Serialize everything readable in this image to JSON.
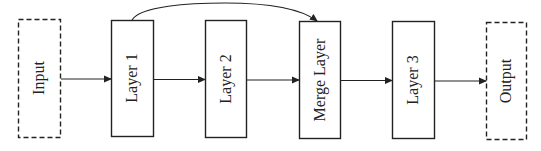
{
  "diagram": {
    "type": "flowchart",
    "direction": "left-to-right",
    "colors": {
      "stroke": "#222222",
      "background": "#ffffff",
      "text": "#222222"
    },
    "nodes": [
      {
        "id": "input",
        "label": "Input",
        "style": "dashed",
        "x": 18,
        "y": 19,
        "w": 42,
        "h": 118
      },
      {
        "id": "layer1",
        "label": "Layer 1",
        "style": "solid",
        "x": 111,
        "y": 20,
        "w": 42,
        "h": 116
      },
      {
        "id": "layer2",
        "label": "Layer 2",
        "style": "solid",
        "x": 205,
        "y": 20,
        "w": 41,
        "h": 117
      },
      {
        "id": "merge",
        "label": "Merge Layer",
        "style": "solid",
        "x": 299,
        "y": 21,
        "w": 41,
        "h": 117
      },
      {
        "id": "layer3",
        "label": "Layer 3",
        "style": "solid",
        "x": 392,
        "y": 21,
        "w": 42,
        "h": 117
      },
      {
        "id": "output",
        "label": "Output",
        "style": "dashed",
        "x": 486,
        "y": 22,
        "w": 40,
        "h": 117
      }
    ],
    "edges": [
      {
        "from": "input",
        "to": "layer1",
        "kind": "straight"
      },
      {
        "from": "layer1",
        "to": "layer2",
        "kind": "straight"
      },
      {
        "from": "layer2",
        "to": "merge",
        "kind": "straight"
      },
      {
        "from": "merge",
        "to": "layer3",
        "kind": "straight"
      },
      {
        "from": "layer3",
        "to": "output",
        "kind": "straight"
      },
      {
        "from": "layer1",
        "to": "merge",
        "kind": "skip-connection-curve"
      }
    ]
  }
}
